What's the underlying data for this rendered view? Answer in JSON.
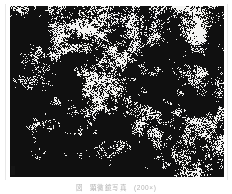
{
  "page": {
    "background_color": "#ffffff",
    "width": 232,
    "height": 194
  },
  "figure": {
    "type": "micrograph",
    "alt_description": "Scanned black and white metallurgical micrograph showing a dense, high-contrast dithered grain structure",
    "plate": {
      "background_color": "#f4f4f2",
      "ink_color": "#101010",
      "left": 10,
      "top": 6,
      "width": 214,
      "height": 171,
      "texture": "dithered halftone speckle, denser dark clusters toward lower-left, finer lighter speckle toward upper-right"
    },
    "corner_mark": {
      "present": true,
      "position": "lower-left"
    }
  },
  "caption": {
    "label": "図",
    "text": "顕微鏡写真",
    "magnification": "(200×)",
    "color": "#b4b4b4",
    "legible": false,
    "note": "caption rendered faint and blurred in the scan"
  }
}
